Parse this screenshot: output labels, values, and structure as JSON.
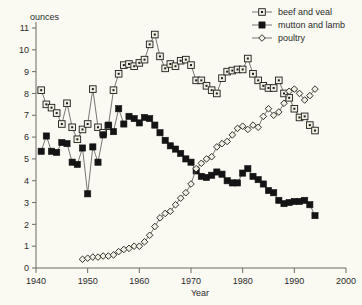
{
  "chart_data": {
    "type": "line",
    "title": "",
    "xlabel": "Year",
    "ylabel": "ounces",
    "unit_label": "ounces",
    "xlim": [
      1940,
      2000
    ],
    "ylim": [
      0,
      11
    ],
    "xticks": [
      1940,
      1950,
      1960,
      1970,
      1980,
      1990,
      2000
    ],
    "xtick_labels": [
      "1940",
      "1950",
      "1960",
      "1970",
      "1980",
      "1990",
      "2000"
    ],
    "yticks": [
      0,
      1,
      2,
      3,
      4,
      5,
      6,
      7,
      8,
      9,
      10,
      11
    ],
    "ytick_labels": [
      "0",
      "1",
      "2",
      "3",
      "4",
      "5",
      "6",
      "7",
      "8",
      "9",
      "10",
      "11"
    ],
    "grid": false,
    "legend_position": "top-right",
    "marker_color": "#f2f0e2",
    "line_color": "#555550",
    "series": [
      {
        "name": "beef and veal",
        "marker": "square-dot",
        "x": [
          1941,
          1942,
          1943,
          1944,
          1945,
          1946,
          1947,
          1948,
          1949,
          1950,
          1951,
          1952,
          1953,
          1954,
          1955,
          1956,
          1957,
          1958,
          1959,
          1960,
          1961,
          1962,
          1963,
          1964,
          1965,
          1966,
          1967,
          1968,
          1969,
          1970,
          1971,
          1972,
          1973,
          1974,
          1975,
          1976,
          1977,
          1978,
          1979,
          1980,
          1981,
          1982,
          1983,
          1984,
          1985,
          1986,
          1987,
          1988,
          1989,
          1990,
          1991,
          1992,
          1993,
          1994
        ],
        "values": [
          8.15,
          7.5,
          7.35,
          7.1,
          6.6,
          7.55,
          6.45,
          5.9,
          6.35,
          6.6,
          8.2,
          6.45,
          6.2,
          6.5,
          8.15,
          8.9,
          9.3,
          9.35,
          9.25,
          9.4,
          9.55,
          10.25,
          10.7,
          9.7,
          9.15,
          9.35,
          9.25,
          9.5,
          9.55,
          9.3,
          8.6,
          8.6,
          8.35,
          8.15,
          8.0,
          8.7,
          9.0,
          9.05,
          9.1,
          9.1,
          9.6,
          8.9,
          8.6,
          8.35,
          8.25,
          8.25,
          8.6,
          8.0,
          7.8,
          7.3,
          6.9,
          6.95,
          6.55,
          6.3
        ],
        "values_note": "approximate readings from the plot"
      },
      {
        "name": "mutton and lamb",
        "marker": "square-filled",
        "x": [
          1941,
          1942,
          1943,
          1944,
          1945,
          1946,
          1947,
          1948,
          1949,
          1950,
          1951,
          1952,
          1953,
          1954,
          1955,
          1956,
          1957,
          1958,
          1959,
          1960,
          1961,
          1962,
          1963,
          1964,
          1965,
          1966,
          1967,
          1968,
          1969,
          1970,
          1971,
          1972,
          1973,
          1974,
          1975,
          1976,
          1977,
          1978,
          1979,
          1980,
          1981,
          1982,
          1983,
          1984,
          1985,
          1986,
          1987,
          1988,
          1989,
          1990,
          1991,
          1992,
          1993,
          1994
        ],
        "values": [
          5.35,
          6.05,
          5.35,
          5.3,
          5.75,
          5.7,
          4.85,
          4.75,
          5.5,
          3.4,
          5.55,
          4.85,
          6.1,
          6.55,
          6.25,
          7.3,
          6.6,
          6.95,
          6.85,
          6.65,
          6.9,
          6.85,
          6.55,
          6.2,
          5.85,
          5.6,
          5.45,
          5.25,
          5.0,
          4.85,
          4.45,
          4.2,
          4.15,
          4.25,
          4.4,
          4.3,
          4.0,
          3.9,
          3.9,
          4.35,
          4.55,
          4.2,
          4.05,
          3.85,
          3.55,
          3.45,
          3.1,
          2.95,
          3.0,
          3.05,
          3.05,
          3.1,
          2.9,
          2.4
        ],
        "values_note": "approximate readings from the plot"
      },
      {
        "name": "poultry",
        "marker": "diamond-open",
        "x": [
          1949,
          1950,
          1951,
          1952,
          1953,
          1954,
          1955,
          1956,
          1957,
          1958,
          1959,
          1960,
          1961,
          1962,
          1963,
          1964,
          1965,
          1966,
          1967,
          1968,
          1969,
          1970,
          1971,
          1972,
          1973,
          1974,
          1975,
          1976,
          1977,
          1978,
          1979,
          1980,
          1981,
          1982,
          1983,
          1984,
          1985,
          1986,
          1987,
          1988,
          1989,
          1990,
          1991,
          1992,
          1993,
          1994
        ],
        "values": [
          0.4,
          0.45,
          0.5,
          0.5,
          0.55,
          0.55,
          0.6,
          0.75,
          0.85,
          0.9,
          1.0,
          1.0,
          1.2,
          1.5,
          1.9,
          2.3,
          2.5,
          2.6,
          2.9,
          3.2,
          3.45,
          3.85,
          4.55,
          4.8,
          5.0,
          5.1,
          5.55,
          5.7,
          5.8,
          6.1,
          6.4,
          6.5,
          6.35,
          6.55,
          6.45,
          6.95,
          7.3,
          7.0,
          7.15,
          7.55,
          8.1,
          8.2,
          8.0,
          7.7,
          7.9,
          8.2
        ],
        "values_note": "approximate readings from the plot"
      }
    ]
  },
  "legend": {
    "items": [
      {
        "label": "beef and veal",
        "marker": "square-dot"
      },
      {
        "label": "mutton and lamb",
        "marker": "square-filled"
      },
      {
        "label": "poultry",
        "marker": "diamond-open"
      }
    ]
  },
  "axes": {
    "y_unit": "ounces",
    "x_title": "Year"
  }
}
